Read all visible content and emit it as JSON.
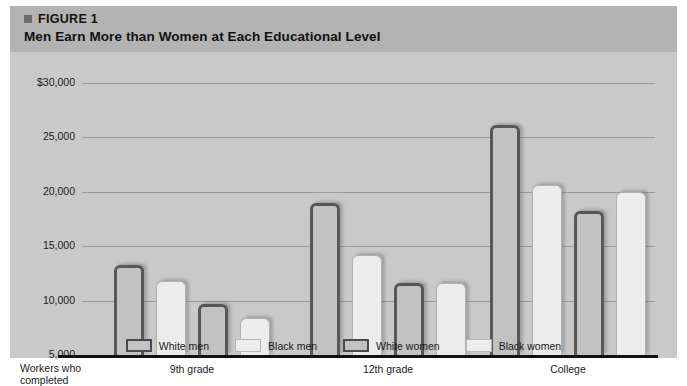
{
  "figure": {
    "number_label": "FIGURE 1",
    "title": "Men Earn More than Women at Each Educational Level",
    "bullet_icon": "square-bullet-icon"
  },
  "colors": {
    "card_background": "#c9c9c9",
    "header_band": "#b3b3b3",
    "gridline": "#9a9a9a",
    "axis": "#111111",
    "outlined_bar_fill": "#c2c2c2",
    "outlined_bar_stroke": "#575757",
    "filled_bar_fill": "#ececec",
    "filled_bar_stroke": "#b0b0b0"
  },
  "axis_note": {
    "line1": "Workers who",
    "line2": "completed"
  },
  "chart_data": {
    "type": "bar",
    "title": "Men Earn More than Women at Each Educational Level",
    "xlabel": "",
    "ylabel": "",
    "ylim": [
      5000,
      30000
    ],
    "ytick_values": [
      5000,
      10000,
      15000,
      20000,
      25000,
      30000
    ],
    "ytick_labels": [
      "5,000",
      "10,000",
      "15,000",
      "20,000",
      "25,000",
      "$30,000"
    ],
    "grid": true,
    "legend_position": "bottom",
    "categories": [
      "9th grade",
      "12th grade",
      "College"
    ],
    "series": [
      {
        "name": "White men",
        "style": "outlined",
        "values": [
          13300,
          19000,
          26100
        ]
      },
      {
        "name": "Black men",
        "style": "filled",
        "values": [
          11800,
          14200,
          20600
        ]
      },
      {
        "name": "White women",
        "style": "outlined",
        "values": [
          9700,
          11600,
          18200
        ]
      },
      {
        "name": "Black women",
        "style": "filled",
        "values": [
          8400,
          11600,
          20000
        ]
      }
    ]
  }
}
